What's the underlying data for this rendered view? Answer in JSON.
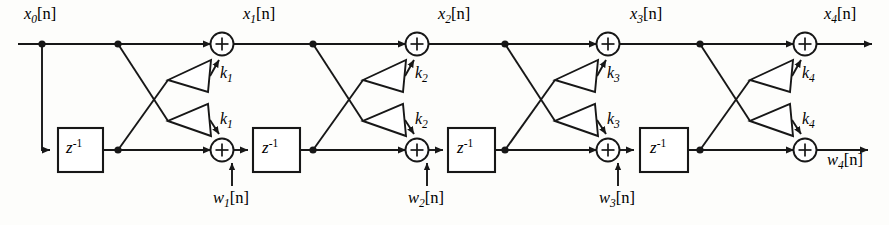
{
  "figure": {
    "type": "signal-flow-diagram",
    "top_rail_label_prefix": "x",
    "bottom_rail_label_prefix": "w",
    "delay_label_base": "z",
    "delay_label_exponent": "-1",
    "bracket_open": "[",
    "bracket_close": "]",
    "index_var": "n",
    "line_color": "#171717",
    "background_color": "#fdfdfb"
  },
  "signals": {
    "input": {
      "base": "x",
      "sub": "0",
      "arg": "[n]",
      "full": "x0[n]"
    },
    "top_nodes": [
      {
        "base": "x",
        "sub": "1",
        "arg": "[n]",
        "full": "x1[n]"
      },
      {
        "base": "x",
        "sub": "2",
        "arg": "[n]",
        "full": "x2[n]"
      },
      {
        "base": "x",
        "sub": "3",
        "arg": "[n]",
        "full": "x3[n]"
      },
      {
        "base": "x",
        "sub": "4",
        "arg": "[n]",
        "full": "x4[n]"
      }
    ],
    "bottom_nodes": [
      {
        "base": "w",
        "sub": "1",
        "arg": "[n]",
        "full": "w1[n]"
      },
      {
        "base": "w",
        "sub": "2",
        "arg": "[n]",
        "full": "w2[n]"
      },
      {
        "base": "w",
        "sub": "3",
        "arg": "[n]",
        "full": "w3[n]"
      },
      {
        "base": "w",
        "sub": "4",
        "arg": "[n]",
        "full": "w4[n]"
      }
    ]
  },
  "stages": [
    {
      "index": 1,
      "coefficient": {
        "base": "k",
        "sub": "1",
        "full": "k1"
      },
      "upper_gain_label": "k1",
      "lower_gain_label": "k1",
      "delay_label": "z^-1",
      "output_top": "x1[n]",
      "output_bottom": "w1[n]"
    },
    {
      "index": 2,
      "coefficient": {
        "base": "k",
        "sub": "2",
        "full": "k2"
      },
      "upper_gain_label": "k2",
      "lower_gain_label": "k2",
      "delay_label": "z^-1",
      "output_top": "x2[n]",
      "output_bottom": "w2[n]"
    },
    {
      "index": 3,
      "coefficient": {
        "base": "k",
        "sub": "3",
        "full": "k3"
      },
      "upper_gain_label": "k3",
      "lower_gain_label": "k3",
      "delay_label": "z^-1",
      "output_top": "x3[n]",
      "output_bottom": "w3[n]"
    },
    {
      "index": 4,
      "coefficient": {
        "base": "k",
        "sub": "4",
        "full": "k4"
      },
      "upper_gain_label": "k4",
      "lower_gain_label": "k4",
      "delay_label": "z^-1",
      "output_top": "x4[n]",
      "output_bottom": "w4[n]"
    }
  ],
  "adders": {
    "symbol": "+",
    "count_top": 4,
    "count_bottom": 4
  }
}
